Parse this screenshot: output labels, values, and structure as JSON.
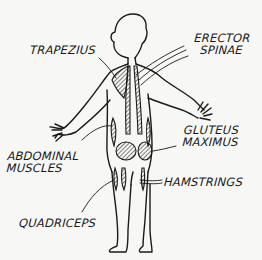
{
  "diagram": {
    "colors": {
      "ink": "#1a1a1a",
      "background": "#f7f7f5"
    },
    "labels": {
      "trapezius": "TRAPEZIUS",
      "erector_spinae_line1": "ERECTOR",
      "erector_spinae_line2": "SPINAE",
      "gluteus_maximus_line1": "GLUTEUS",
      "gluteus_maximus_line2": "MAXIMUS",
      "abdominal_muscles_line1": "ABDOMINAL",
      "abdominal_muscles_line2": "MUSCLES",
      "hamstrings": "HAMSTRINGS",
      "quadriceps": "QUADRICEPS"
    }
  }
}
